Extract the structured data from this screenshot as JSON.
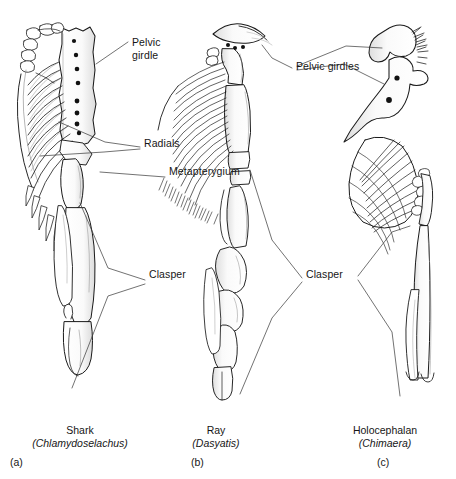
{
  "figure": {
    "type": "comparative-anatomy-diagram",
    "background_color": "#ffffff",
    "ink_color": "#1a1a1a",
    "leader_color": "#3a3a3a"
  },
  "labels": {
    "pelvic_girdle_line1": "Pelvic",
    "pelvic_girdle_line2": "girdle",
    "radials": "Radials",
    "metapterygium": "Metapterygium",
    "clasper_left": "Clasper",
    "pelvic_girdles": "Pelvic girdles",
    "clasper_right": "Clasper"
  },
  "panels": [
    {
      "id": "a",
      "common_name": "Shark",
      "scientific_name": "(Chlamydoselachus)",
      "panel_letter": "(a)",
      "features": [
        "pelvic girdle",
        "radials",
        "metapterygium",
        "clasper"
      ],
      "foramina_count": 8
    },
    {
      "id": "b",
      "common_name": "Ray",
      "scientific_name": "(Dasyatis)",
      "panel_letter": "(b)",
      "features": [
        "pelvic girdle",
        "basipterygium",
        "segmented clasper"
      ],
      "foramina_count": 3
    },
    {
      "id": "c",
      "common_name": "Holocephalan",
      "scientific_name": "(Chimaera)",
      "panel_letter": "(c)",
      "features": [
        "pelvic girdle",
        "fan-shaped fin",
        "bifurcated clasper"
      ],
      "foramina_count": 2
    }
  ]
}
